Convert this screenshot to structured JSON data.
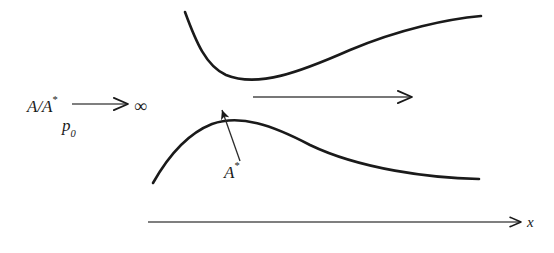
{
  "figure": {
    "background_color": "#ffffff",
    "stroke_color": "#1a1a1a",
    "width": 554,
    "height": 253
  },
  "labels": {
    "area_ratio": {
      "base": "A/A",
      "superscript": "*",
      "name": "area-ratio-label"
    },
    "infinity": {
      "symbol": "∞",
      "name": "infinity-symbol"
    },
    "stagnation_pressure": {
      "base": "p",
      "subscript": "0",
      "name": "stagnation-pressure-label"
    },
    "throat_area": {
      "base": "A",
      "superscript": "*",
      "name": "throat-area-label"
    },
    "x_axis": {
      "text": "x",
      "name": "x-axis-label"
    }
  },
  "arrows": {
    "area_ratio_arrow": {
      "name": "area-ratio-arrow",
      "from_x": 72,
      "from_y": 104,
      "to_x": 128,
      "to_y": 104
    },
    "flow_arrow": {
      "name": "flow-direction-arrow",
      "from_x": 253,
      "from_y": 97,
      "to_x": 412,
      "to_y": 97
    },
    "throat_pointer": {
      "name": "throat-pointer-arrow",
      "from_x": 240,
      "from_y": 161,
      "to_x": 222,
      "to_y": 110
    },
    "x_axis_arrow": {
      "name": "x-axis-arrow",
      "from_x": 148,
      "from_y": 222,
      "to_x": 521,
      "to_y": 222
    }
  },
  "chart_data": {
    "type": "line",
    "xlabel": "x",
    "ylabel": "",
    "xlim": [
      0,
      554
    ],
    "ylim": [
      0,
      253
    ],
    "grid": false,
    "legend": null,
    "annotations": [
      {
        "text": "A/A* → ∞",
        "x": 27,
        "y": 104
      },
      {
        "text": "p₀",
        "x": 62,
        "y": 124
      },
      {
        "text": "A*",
        "x": 224,
        "y": 172
      },
      {
        "text": "x",
        "x": 527,
        "y": 222
      }
    ],
    "series": [
      {
        "name": "upper-nozzle-wall",
        "path": "M 185 12 C 196 42, 206 66, 226 75 C 258 88, 300 72, 350 50 C 400 29, 448 19, 481 16",
        "points": [
          [
            185,
            12
          ],
          [
            195,
            38
          ],
          [
            206,
            57
          ],
          [
            218,
            70
          ],
          [
            228,
            75
          ],
          [
            248,
            79
          ],
          [
            272,
            75
          ],
          [
            300,
            67
          ],
          [
            330,
            57
          ],
          [
            362,
            45
          ],
          [
            398,
            32
          ],
          [
            432,
            23
          ],
          [
            460,
            18
          ],
          [
            481,
            16
          ]
        ]
      },
      {
        "name": "lower-nozzle-wall",
        "path": "M 153 183 C 166 160, 184 135, 212 124 C 240 114, 272 125, 310 145 C 360 169, 430 178, 479 179",
        "points": [
          [
            153,
            183
          ],
          [
            163,
            164
          ],
          [
            176,
            147
          ],
          [
            192,
            133
          ],
          [
            212,
            124
          ],
          [
            232,
            120
          ],
          [
            252,
            125
          ],
          [
            278,
            134
          ],
          [
            306,
            145
          ],
          [
            340,
            159
          ],
          [
            378,
            170
          ],
          [
            420,
            176
          ],
          [
            452,
            179
          ],
          [
            479,
            179
          ]
        ]
      }
    ]
  }
}
